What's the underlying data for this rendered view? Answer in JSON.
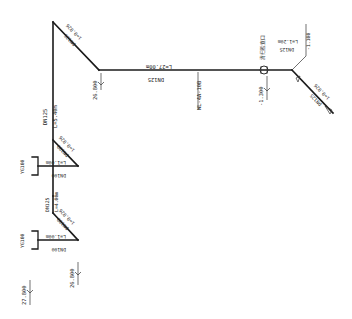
{
  "diagram": {
    "type": "pipe-isometric-drawing",
    "colors": {
      "line": "#1a1a1a",
      "background": "#ffffff"
    },
    "segments": {
      "top_diagonal": {
        "slope_label": "i=0.026",
        "size_label": "DN125"
      },
      "main_horizontal": {
        "length_label": "L=27.00m",
        "size_label": "DN125"
      },
      "left_vertical": {
        "size_label": "DN125",
        "length_label": "L=5.40m"
      },
      "right_riser": {
        "size_label": "DN125",
        "length_label": "L=1.20m",
        "elevation_label": "-1.100"
      },
      "right_diagonal": {
        "slope_label": "i=0.026",
        "size_label": "DN125"
      },
      "lower_vertical": {
        "size_label": "DN125",
        "length_label": "L=4.00m"
      },
      "branch_upper_diagonal": {
        "slope_label": "i=0.026",
        "size_label": "DN100"
      },
      "branch_upper_horizontal": {
        "length_label": "L=1.00m",
        "size_label": "DN100"
      },
      "branch_lower_diagonal": {
        "slope_label": "i=0.026",
        "size_label": "DN100"
      },
      "branch_lower_horizontal": {
        "length_label": "L=1.00m",
        "size_label": "DN100"
      }
    },
    "fixtures": [
      {
        "label": "YG100"
      },
      {
        "label": "YG100"
      }
    ],
    "device": {
      "label": "清扫检查口",
      "tag": "WL-4A-10B"
    },
    "elevations": {
      "corner_top": "26.800",
      "valve_below": "-1.300",
      "branch_lower": "26.800",
      "base": "27.800"
    }
  }
}
